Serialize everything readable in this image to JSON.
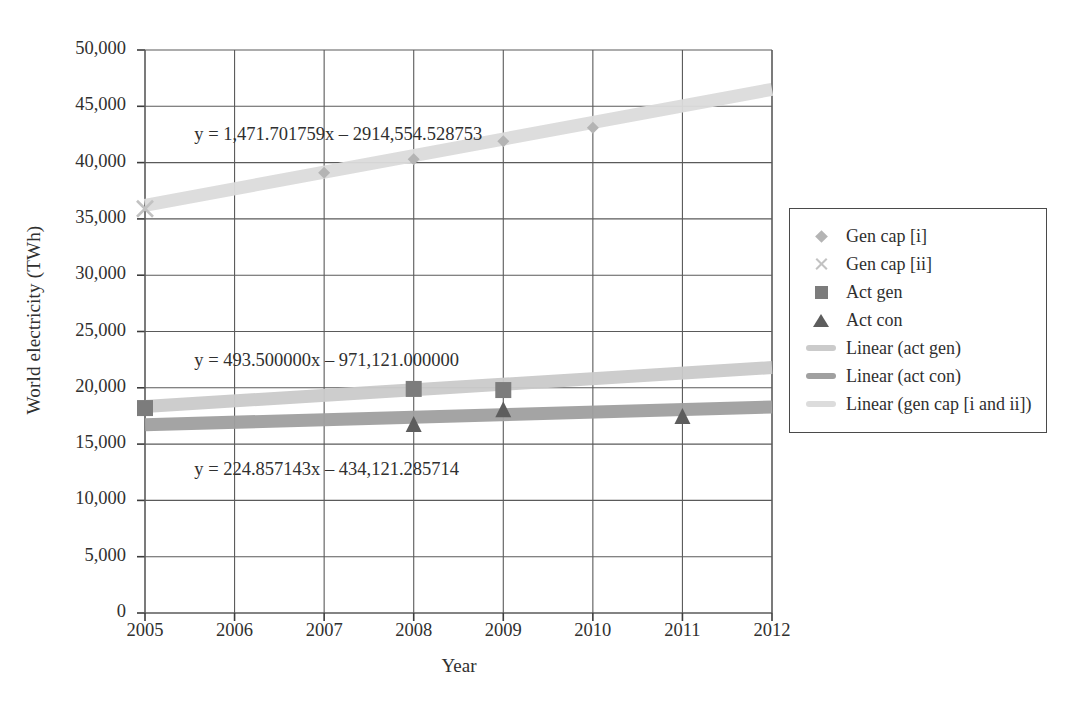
{
  "chart_data": {
    "type": "scatter",
    "title": "",
    "xlabel": "Year",
    "ylabel": "World electricity (TWh)",
    "xlim": [
      2005,
      2012
    ],
    "ylim": [
      0,
      50000
    ],
    "xticks": [
      "2005",
      "2006",
      "2007",
      "2008",
      "2009",
      "2010",
      "2011",
      "2012"
    ],
    "yticks": [
      "0",
      "5,000",
      "10,000",
      "15,000",
      "20,000",
      "25,000",
      "30,000",
      "35,000",
      "40,000",
      "45,000",
      "50,000"
    ],
    "grid": true,
    "legend_position": "right",
    "series": [
      {
        "name": "Gen cap [i]",
        "marker": "diamond",
        "color": "#b4b4b4",
        "points": [
          {
            "x": 2007,
            "y": 39100
          },
          {
            "x": 2008,
            "y": 40300
          },
          {
            "x": 2009,
            "y": 41900
          },
          {
            "x": 2010,
            "y": 43100
          }
        ]
      },
      {
        "name": "Gen cap [ii]",
        "marker": "cross",
        "color": "#c2c2c2",
        "points": [
          {
            "x": 2005,
            "y": 35900
          }
        ]
      },
      {
        "name": "Act gen",
        "marker": "square",
        "color": "#7c7c7c",
        "points": [
          {
            "x": 2005,
            "y": 18200
          },
          {
            "x": 2008,
            "y": 19900
          },
          {
            "x": 2009,
            "y": 19800
          }
        ]
      },
      {
        "name": "Act con",
        "marker": "triangle",
        "color": "#5d5d5d",
        "points": [
          {
            "x": 2008,
            "y": 16700
          },
          {
            "x": 2009,
            "y": 18000
          },
          {
            "x": 2011,
            "y": 17400
          }
        ]
      }
    ],
    "trendlines": [
      {
        "name": "Linear (act gen)",
        "color": "#cbcbcb",
        "slope": 493.5,
        "intercept": -971121.0,
        "equation": "y = 493.500000x – 971,121.000000",
        "equation_x": 2005.55,
        "equation_y": 22300
      },
      {
        "name": "Linear (act con)",
        "color": "#a0a0a0",
        "slope": 224.857143,
        "intercept": -434121.285714,
        "equation": "y = 224.857143x – 434,121.285714",
        "equation_x": 2005.55,
        "equation_y": 12650
      },
      {
        "name": "Linear (gen cap [i and ii])",
        "color": "#dcdcdc",
        "slope": 1471.701759,
        "intercept": -2914554.528753,
        "equation": "y = 1,471.701759x – 2914,554.528753",
        "equation_x": 2005.55,
        "equation_y": 42400
      }
    ],
    "legend": [
      {
        "label": "Gen cap [i]",
        "marker": "diamond",
        "color": "#b4b4b4"
      },
      {
        "label": "Gen cap [ii]",
        "marker": "cross",
        "color": "#c2c2c2"
      },
      {
        "label": "Act gen",
        "marker": "square",
        "color": "#7c7c7c"
      },
      {
        "label": "Act con",
        "marker": "triangle",
        "color": "#5d5d5d"
      },
      {
        "label": "Linear (act gen)",
        "marker": "line",
        "color": "#cbcbcb"
      },
      {
        "label": "Linear (act con)",
        "marker": "line",
        "color": "#a0a0a0"
      },
      {
        "label": "Linear (gen cap [i and ii])",
        "marker": "line",
        "color": "#dcdcdc"
      }
    ]
  },
  "style": {
    "axis_color": "#3c3c3c",
    "grid_color": "#5a5a5a",
    "text_color": "#30302f",
    "background": "#ffffff"
  }
}
